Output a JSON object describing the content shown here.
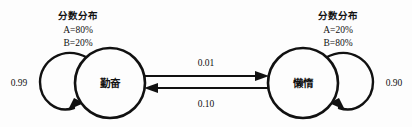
{
  "diagram": {
    "type": "markov-chain-state-transition",
    "states": [
      {
        "id": "diligent",
        "label": "勤奋",
        "cx": 110,
        "cy": 83,
        "r": 35,
        "self_loop_probability": "0.99",
        "distribution": {
          "title": "分数分布",
          "lines": [
            "A=80%",
            "B=20%"
          ]
        }
      },
      {
        "id": "lazy",
        "label": "懒惰",
        "cx": 303,
        "cy": 83,
        "r": 35,
        "self_loop_probability": "0.90",
        "distribution": {
          "title": "分数分布",
          "lines": [
            "A=20%",
            "B=80%"
          ]
        }
      }
    ],
    "transitions": [
      {
        "id": "diligent-to-lazy",
        "from": "diligent",
        "to": "lazy",
        "probability": "0.01",
        "direction": "right"
      },
      {
        "id": "lazy-to-diligent",
        "from": "lazy",
        "to": "diligent",
        "probability": "0.10",
        "direction": "left"
      }
    ],
    "colors": {
      "stroke": "#111111",
      "background": "#fdfdfd",
      "node_fill": "#fdfdfd",
      "text": "#111111"
    }
  }
}
